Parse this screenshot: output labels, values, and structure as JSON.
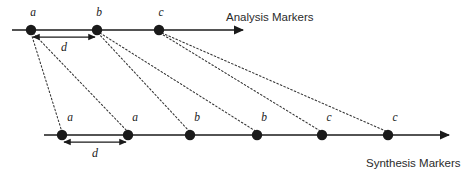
{
  "figure": {
    "colors": {
      "line": "#1a1a1a",
      "marker": "#1a1a1a",
      "connector": "#333333",
      "text": "#2b2b2b",
      "background": "#ffffff"
    }
  },
  "analysis": {
    "caption": "Analysis Markers",
    "caption_x": 226,
    "caption_y": 21,
    "axis": {
      "x1": 12,
      "x2": 243,
      "y": 30
    },
    "markers": [
      {
        "id": "analysis-marker-a",
        "label": "a",
        "x": 31,
        "y": 30,
        "label_x": 33,
        "label_y": 16
      },
      {
        "id": "analysis-marker-b",
        "label": "b",
        "x": 97,
        "y": 30,
        "label_x": 99,
        "label_y": 16
      },
      {
        "id": "analysis-marker-c",
        "label": "c",
        "x": 159,
        "y": 30,
        "label_x": 161,
        "label_y": 16
      }
    ],
    "spacing": {
      "label": "d",
      "x1": 33,
      "x2": 95,
      "y": 37,
      "label_x": 64,
      "label_y": 51
    }
  },
  "synthesis": {
    "caption": "Synthesis Markers",
    "caption_x": 366,
    "caption_y": 167,
    "axis": {
      "x1": 44,
      "x2": 449,
      "y": 135
    },
    "markers": [
      {
        "id": "synthesis-marker-a1",
        "label": "a",
        "x": 62,
        "y": 135,
        "label_x": 68,
        "label_y": 121
      },
      {
        "id": "synthesis-marker-a2",
        "label": "a",
        "x": 128,
        "y": 135,
        "label_x": 133,
        "label_y": 121
      },
      {
        "id": "synthesis-marker-b1",
        "label": "b",
        "x": 190,
        "y": 135,
        "label_x": 195,
        "label_y": 121
      },
      {
        "id": "synthesis-marker-b2",
        "label": "b",
        "x": 257,
        "y": 135,
        "label_x": 262,
        "label_y": 121
      },
      {
        "id": "synthesis-marker-c1",
        "label": "c",
        "x": 322,
        "y": 135,
        "label_x": 327,
        "label_y": 121
      },
      {
        "id": "synthesis-marker-c2",
        "label": "c",
        "x": 388,
        "y": 135,
        "label_x": 393,
        "label_y": 121
      }
    ],
    "spacing": {
      "label": "d",
      "x1": 64,
      "x2": 126,
      "y": 142,
      "label_x": 93,
      "label_y": 157
    }
  },
  "connectors": [
    {
      "id": "connector-a-to-a1",
      "from": "a",
      "x1": 31,
      "y1": 33,
      "x2": 62,
      "y2": 132
    },
    {
      "id": "connector-a-to-a2",
      "from": "a",
      "x1": 33,
      "y1": 33,
      "x2": 128,
      "y2": 132
    },
    {
      "id": "connector-b-to-b1",
      "from": "b",
      "x1": 98,
      "y1": 33,
      "x2": 190,
      "y2": 132
    },
    {
      "id": "connector-b-to-b2",
      "from": "b",
      "x1": 100,
      "y1": 33,
      "x2": 257,
      "y2": 132
    },
    {
      "id": "connector-c-to-c1",
      "from": "c",
      "x1": 160,
      "y1": 33,
      "x2": 322,
      "y2": 132
    },
    {
      "id": "connector-c-to-c2",
      "from": "c",
      "x1": 162,
      "y1": 33,
      "x2": 388,
      "y2": 132
    }
  ]
}
